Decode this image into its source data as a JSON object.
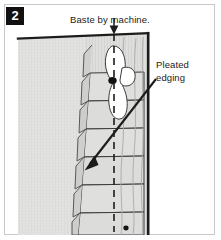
{
  "figure": {
    "step_number": "2",
    "top_caption": "Baste by machine.",
    "right_label_line1": "Pleated",
    "right_label_line2": "edging"
  },
  "icons": {
    "down_arrow": "down-arrow-icon",
    "leader_arrow": "leader-arrow-icon"
  },
  "colors": {
    "ink": "#1b1b1b",
    "fabric_fill": "#e2e2e0",
    "fabric_fill_dark": "#d2d2d0",
    "pleat_fill": "#dcdcda",
    "white": "#ffffff",
    "frame": "#c9c9c9",
    "badge_bg": "#111111"
  },
  "diagram": {
    "type": "technical-line-illustration",
    "elements": [
      {
        "name": "main-fabric-panel",
        "description": "large shaded fabric field on left"
      },
      {
        "name": "fabric-top-edge",
        "description": "thick dark slightly sloping top edge"
      },
      {
        "name": "fabric-right-edge",
        "description": "thick dark vertical right edge"
      },
      {
        "name": "pleated-edging-band",
        "description": "vertical band of stacked pleat folds"
      },
      {
        "name": "basting-stitch-line",
        "description": "vertical dashed machine basting line"
      },
      {
        "name": "ruffle-detail",
        "description": "white pinched ruffle shape near top of band"
      },
      {
        "name": "pin-dot",
        "description": "small dark dot at ruffle waist"
      },
      {
        "name": "bottom-dot",
        "description": "small dark dot at bottom of basting line"
      }
    ],
    "pleat_count": 7
  }
}
